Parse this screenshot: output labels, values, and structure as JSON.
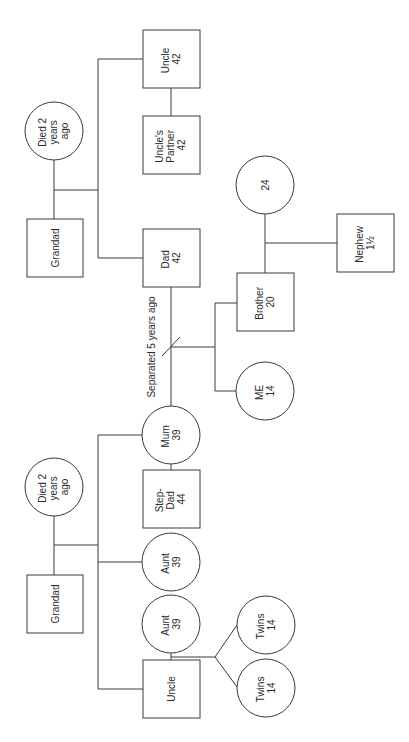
{
  "diagram": {
    "type": "genogram",
    "orientation": "rotated -90deg",
    "separation_label": "Separated 5 years ago",
    "people": [
      {
        "id": "grandad_paternal",
        "shape": "square",
        "lines": [
          "Grandad"
        ]
      },
      {
        "id": "grandmother_paternal",
        "shape": "circle",
        "lines": [
          "Died 2",
          "years",
          "ago"
        ]
      },
      {
        "id": "uncle_paternal",
        "shape": "square",
        "lines": [
          "Uncle",
          "42"
        ]
      },
      {
        "id": "uncles_partner",
        "shape": "square",
        "lines": [
          "Uncle's",
          "Partner",
          "42"
        ]
      },
      {
        "id": "dad",
        "shape": "square",
        "lines": [
          "Dad",
          "42"
        ]
      },
      {
        "id": "brothers_partner",
        "shape": "circle",
        "lines": [
          "24"
        ]
      },
      {
        "id": "nephew",
        "shape": "square",
        "lines": [
          "Nephew",
          "1½"
        ]
      },
      {
        "id": "brother",
        "shape": "square",
        "lines": [
          "Brother",
          "20"
        ]
      },
      {
        "id": "me",
        "shape": "circle",
        "lines": [
          "ME",
          "14"
        ]
      },
      {
        "id": "mum",
        "shape": "circle",
        "lines": [
          "Mum",
          "39"
        ]
      },
      {
        "id": "step_dad",
        "shape": "square",
        "lines": [
          "Step-",
          "Dad",
          "44"
        ]
      },
      {
        "id": "grandad_maternal",
        "shape": "square",
        "lines": [
          "Grandad"
        ]
      },
      {
        "id": "grandmother_maternal",
        "shape": "circle",
        "lines": [
          "Died 2",
          "years",
          "ago"
        ]
      },
      {
        "id": "aunt_1",
        "shape": "circle",
        "lines": [
          "Aunt",
          "39"
        ]
      },
      {
        "id": "aunt_2",
        "shape": "circle",
        "lines": [
          "Aunt",
          "39"
        ]
      },
      {
        "id": "uncle_maternal",
        "shape": "square",
        "lines": [
          "Uncle"
        ]
      },
      {
        "id": "twin_1",
        "shape": "circle",
        "lines": [
          "Twins",
          "14"
        ]
      },
      {
        "id": "twin_2",
        "shape": "circle",
        "lines": [
          "Twins",
          "14"
        ]
      }
    ]
  }
}
